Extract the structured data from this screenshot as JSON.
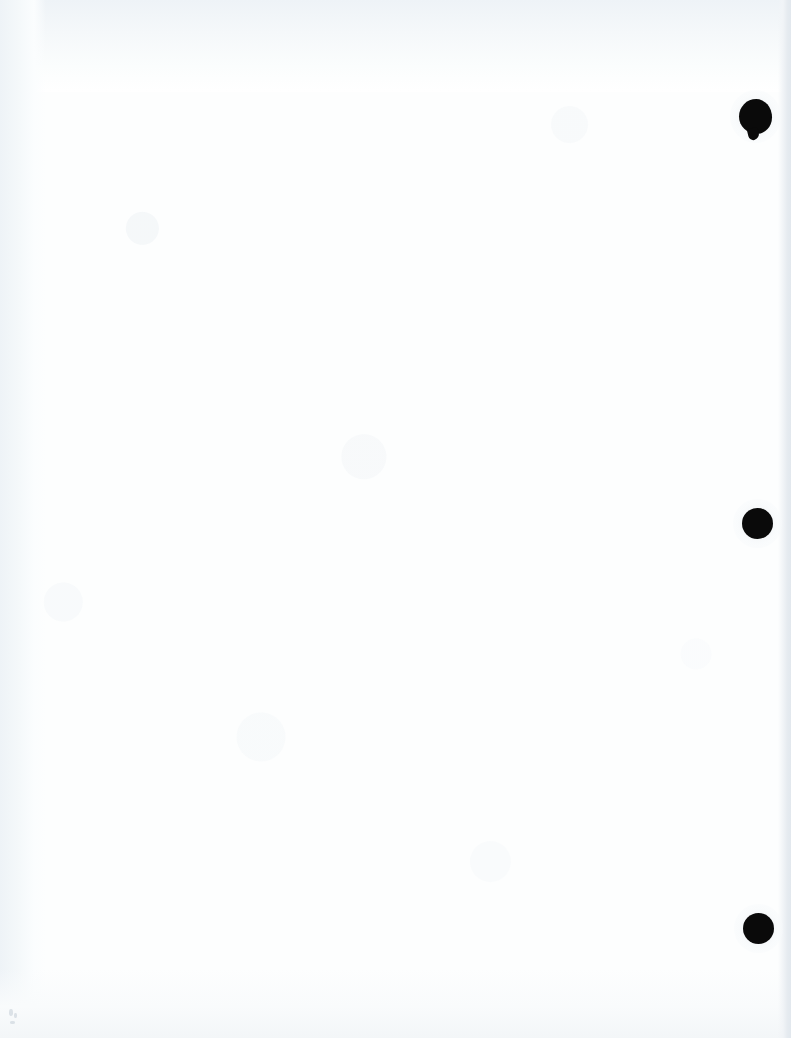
{
  "document": {
    "kind": "scanned-page",
    "page_state": "blank",
    "orientation": "portrait",
    "width_px": 791,
    "height_px": 1038,
    "visible_text": "",
    "paper_color": "#fdfefe",
    "scan_edge_color": "#e2e8ee",
    "scan_tint_color": "#eef3f7"
  },
  "binding": {
    "type": "three-ring-hole-punch",
    "margin_side": "right",
    "mark_color": "#0a0a0a",
    "count": 3,
    "holes": [
      {
        "name": "top",
        "shape": "irregular-circle",
        "left_px": 739,
        "top_px": 99,
        "width_px": 33,
        "height_px": 35
      },
      {
        "name": "middle",
        "shape": "circle",
        "left_px": 742,
        "top_px": 508,
        "width_px": 31,
        "height_px": 31
      },
      {
        "name": "bottom",
        "shape": "circle",
        "left_px": 743,
        "top_px": 913,
        "width_px": 31,
        "height_px": 31
      }
    ]
  },
  "artifacts": {
    "specks": [
      {
        "left_px": 9,
        "top_px": 1009,
        "width_px": 4,
        "height_px": 7
      },
      {
        "left_px": 14,
        "top_px": 1013,
        "width_px": 3,
        "height_px": 5
      },
      {
        "left_px": 10,
        "top_px": 1021,
        "width_px": 5,
        "height_px": 3
      }
    ]
  }
}
